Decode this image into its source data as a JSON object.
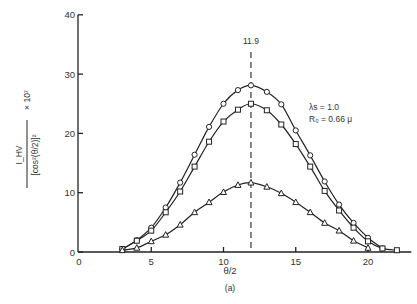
{
  "chart_data": {
    "type": "line",
    "title": "",
    "caption": "(a)",
    "xlabel": "θ/2",
    "ylabel": {
      "numerator": "I_HV",
      "denominator": "[cos²(θ/2)]²",
      "multiplier": "× 10⁷"
    },
    "xlim": [
      0,
      23
    ],
    "ylim": [
      0,
      40
    ],
    "xticks": [
      0,
      5,
      10,
      15,
      20
    ],
    "yticks": [
      0,
      10,
      20,
      30,
      40
    ],
    "grid": false,
    "reference_line": {
      "x": 11.9,
      "label": "11.9",
      "style": "dashed"
    },
    "annotations": [
      "λs = 1.0",
      "R₀ = 0.66 μ"
    ],
    "series": [
      {
        "name": "circles",
        "marker": "circle",
        "x": [
          3,
          4,
          5,
          6,
          7,
          8,
          9,
          10,
          11,
          11.9,
          13,
          14,
          15,
          16,
          17,
          18,
          19,
          20,
          21
        ],
        "values": [
          0.5,
          2.0,
          4.1,
          7.5,
          11.7,
          16.4,
          21.1,
          25.0,
          27.3,
          28.1,
          27.0,
          24.9,
          20.5,
          16.3,
          11.9,
          8.0,
          4.9,
          2.4,
          0.6
        ]
      },
      {
        "name": "squares",
        "marker": "square",
        "x": [
          3,
          4,
          5,
          6,
          7,
          8,
          9,
          10,
          11,
          11.9,
          13,
          14,
          15,
          16,
          17,
          18,
          19,
          20,
          21,
          22
        ],
        "values": [
          0.5,
          1.9,
          3.6,
          6.7,
          10.2,
          14.4,
          18.6,
          22.0,
          24.0,
          25.0,
          23.9,
          21.5,
          18.2,
          14.4,
          10.3,
          7.0,
          4.1,
          1.8,
          0.6,
          0.3
        ]
      },
      {
        "name": "triangles",
        "marker": "triangle",
        "x": [
          3,
          4,
          5,
          6,
          7,
          8,
          9,
          10,
          11,
          11.9,
          13,
          14,
          15,
          16,
          17,
          18,
          19,
          20
        ],
        "values": [
          0.3,
          0.7,
          1.8,
          2.9,
          4.6,
          6.7,
          8.4,
          10.1,
          11.3,
          11.7,
          11.0,
          9.9,
          8.4,
          6.7,
          4.9,
          3.6,
          1.9,
          0.7
        ]
      }
    ]
  }
}
